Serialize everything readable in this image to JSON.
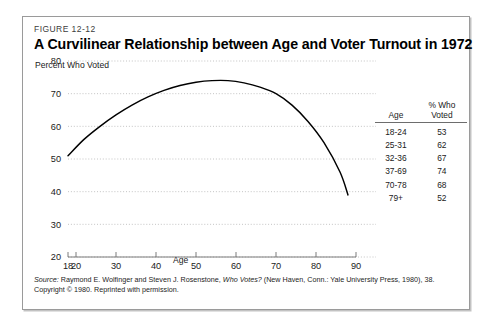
{
  "figure": {
    "number": "FIGURE 12-12",
    "title": "A Curvilinear Relationship between Age and Voter Turnout in 1972"
  },
  "source": {
    "line1_label": "Source:",
    "line1_a": " Raymond E. Wolfinger and Steven J. Rosenstone, ",
    "line1_italic": "Who Votes?",
    "line1_b": " (New Haven, Conn.: Yale University Press, 1980), 38.",
    "line2": "Copyright © 1980. Reprinted with permission."
  },
  "table": {
    "headers": [
      "Age",
      "% Who Voted"
    ],
    "header_age": "Age",
    "header_pct_line1": "% Who",
    "header_pct_line2": "Voted",
    "rows": [
      {
        "age": "18-24",
        "pct": "53"
      },
      {
        "age": "25-31",
        "pct": "62"
      },
      {
        "age": "32-36",
        "pct": "67"
      },
      {
        "age": "37-69",
        "pct": "74"
      },
      {
        "age": "70-78",
        "pct": "68"
      },
      {
        "age": "79+",
        "pct": "52"
      }
    ]
  },
  "axes": {
    "y_title": "Percent Who Voted",
    "x_title": "Age",
    "y_ticks": [
      "80",
      "70",
      "60",
      "50",
      "40",
      "30",
      "20"
    ],
    "x_ticks": [
      "18",
      "20",
      "30",
      "40",
      "50",
      "60",
      "70",
      "80",
      "90"
    ]
  },
  "colors": {
    "curve": "#000000",
    "grid": "#bdbdbd",
    "axis": "#6d6d6d",
    "border": "#9a9a9a",
    "text": "#1a1a1a"
  },
  "chart_data": {
    "type": "line",
    "title": "A Curvilinear Relationship between Age and Voter Turnout in 1972",
    "xlabel": "Age",
    "ylabel": "Percent Who Voted",
    "xlim": [
      18,
      90
    ],
    "ylim": [
      20,
      80
    ],
    "grid": true,
    "legend": "none",
    "x_ticks": [
      18,
      20,
      30,
      40,
      50,
      60,
      70,
      80,
      90
    ],
    "y_ticks": [
      20,
      30,
      40,
      50,
      60,
      70,
      80
    ],
    "series": [
      {
        "name": "Percent Who Voted",
        "x": [
          18,
          22,
          26,
          30,
          34,
          38,
          42,
          46,
          50,
          54,
          58,
          62,
          66,
          70,
          74,
          78,
          82,
          86,
          88
        ],
        "values": [
          51,
          56,
          60,
          63.5,
          66.5,
          69,
          71,
          72.5,
          73.5,
          74,
          74,
          73.3,
          72,
          70,
          66.5,
          61.5,
          55,
          46,
          39
        ]
      }
    ],
    "annotations_table": {
      "columns": [
        "Age",
        "% Who Voted"
      ],
      "rows": [
        [
          "18-24",
          53
        ],
        [
          "25-31",
          62
        ],
        [
          "32-36",
          67
        ],
        [
          "37-69",
          74
        ],
        [
          "70-78",
          68
        ],
        [
          "79+",
          52
        ]
      ]
    }
  }
}
